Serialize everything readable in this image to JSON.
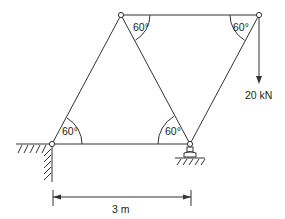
{
  "diagram": {
    "type": "truss",
    "nodes": {
      "top_left": [
        121,
        15
      ],
      "top_right": [
        259,
        15
      ],
      "bottom_left": [
        52,
        144
      ],
      "bottom_right": [
        190,
        144
      ]
    },
    "angles": {
      "top_left": "60°",
      "top_right": "60°",
      "bottom_left": "60°",
      "bottom_right": "60°"
    },
    "load": {
      "label": "20 kN",
      "direction": "down"
    },
    "dimension": {
      "label": "3 m"
    },
    "supports": {
      "left": "pin-wall",
      "right": "roller"
    },
    "colors": {
      "line": "#333333"
    }
  }
}
